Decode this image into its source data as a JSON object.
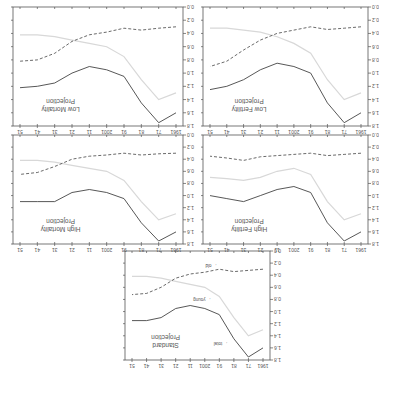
{
  "figure": {
    "orientation": "rotated 180 degrees",
    "x_ticks": [
      "1961",
      "71",
      "81",
      "91",
      "2001",
      "11",
      "21",
      "31",
      "41",
      "51"
    ],
    "y_ticks": [
      "0.0",
      "0.2",
      "0.4",
      "0.6",
      "0.8",
      "1.0",
      "1.2",
      "1.4",
      "1.6",
      "1.8"
    ],
    "series_labels": {
      "total": "total",
      "young": "young",
      "old": "old"
    }
  },
  "chart_data": [
    {
      "type": "line",
      "title": "Standard Projection",
      "x": [
        1961,
        1971,
        1981,
        1991,
        2001,
        2011,
        2021,
        2031,
        2041,
        2051
      ],
      "ylim": [
        0,
        1.8
      ],
      "series": [
        {
          "name": "total",
          "values": [
            1.6,
            1.75,
            1.45,
            1.05,
            0.95,
            0.9,
            0.95,
            1.1,
            1.15,
            1.15
          ]
        },
        {
          "name": "young",
          "values": [
            1.3,
            1.4,
            1.1,
            0.75,
            0.6,
            0.55,
            0.5,
            0.45,
            0.42,
            0.42
          ]
        },
        {
          "name": "old",
          "values": [
            0.3,
            0.32,
            0.34,
            0.3,
            0.35,
            0.38,
            0.45,
            0.6,
            0.7,
            0.72
          ]
        }
      ],
      "annotations": [
        "total",
        "young",
        "old"
      ]
    },
    {
      "type": "line",
      "title": "High Fertility Projection",
      "x": [
        1961,
        1971,
        1981,
        1991,
        2001,
        2011,
        2021,
        2031,
        2041,
        2051
      ],
      "ylim": [
        0,
        1.8
      ],
      "series": [
        {
          "name": "total",
          "values": [
            1.6,
            1.75,
            1.45,
            0.95,
            0.85,
            0.9,
            1.0,
            1.1,
            1.05,
            1.0
          ]
        },
        {
          "name": "young",
          "values": [
            1.3,
            1.4,
            1.1,
            0.65,
            0.55,
            0.6,
            0.7,
            0.75,
            0.72,
            0.7
          ]
        },
        {
          "name": "old",
          "values": [
            0.3,
            0.32,
            0.34,
            0.3,
            0.32,
            0.34,
            0.36,
            0.42,
            0.38,
            0.35
          ]
        }
      ]
    },
    {
      "type": "line",
      "title": "High Mortality Projection",
      "x": [
        1961,
        1971,
        1981,
        1991,
        2001,
        2011,
        2021,
        2031,
        2041,
        2051
      ],
      "ylim": [
        0,
        1.8
      ],
      "series": [
        {
          "name": "total",
          "values": [
            1.6,
            1.75,
            1.45,
            1.05,
            0.95,
            0.9,
            0.95,
            1.1,
            1.1,
            1.1
          ]
        },
        {
          "name": "young",
          "values": [
            1.3,
            1.4,
            1.1,
            0.75,
            0.6,
            0.55,
            0.5,
            0.45,
            0.42,
            0.42
          ]
        },
        {
          "name": "old",
          "values": [
            0.3,
            0.31,
            0.33,
            0.3,
            0.33,
            0.35,
            0.4,
            0.52,
            0.62,
            0.65
          ]
        }
      ]
    },
    {
      "type": "line",
      "title": "Low Fertility Projection",
      "x": [
        1961,
        1971,
        1981,
        1991,
        2001,
        2011,
        2021,
        2031,
        2041,
        2051
      ],
      "ylim": [
        0,
        1.8
      ],
      "series": [
        {
          "name": "total",
          "values": [
            1.6,
            1.75,
            1.45,
            1.0,
            0.9,
            0.85,
            0.95,
            1.1,
            1.2,
            1.25
          ]
        },
        {
          "name": "young",
          "values": [
            1.3,
            1.4,
            1.1,
            0.7,
            0.55,
            0.45,
            0.38,
            0.35,
            0.32,
            0.32
          ]
        },
        {
          "name": "old",
          "values": [
            0.3,
            0.32,
            0.34,
            0.3,
            0.35,
            0.4,
            0.5,
            0.65,
            0.82,
            0.9
          ]
        }
      ]
    },
    {
      "type": "line",
      "title": "Low Mortality Projection",
      "x": [
        1961,
        1971,
        1981,
        1991,
        2001,
        2011,
        2021,
        2031,
        2041,
        2051
      ],
      "ylim": [
        0,
        1.8
      ],
      "series": [
        {
          "name": "total",
          "values": [
            1.6,
            1.75,
            1.45,
            1.05,
            0.95,
            0.9,
            1.0,
            1.15,
            1.2,
            1.22
          ]
        },
        {
          "name": "young",
          "values": [
            1.3,
            1.4,
            1.1,
            0.75,
            0.6,
            0.55,
            0.5,
            0.45,
            0.42,
            0.42
          ]
        },
        {
          "name": "old",
          "values": [
            0.3,
            0.32,
            0.35,
            0.32,
            0.38,
            0.42,
            0.52,
            0.7,
            0.8,
            0.82
          ]
        }
      ]
    }
  ]
}
